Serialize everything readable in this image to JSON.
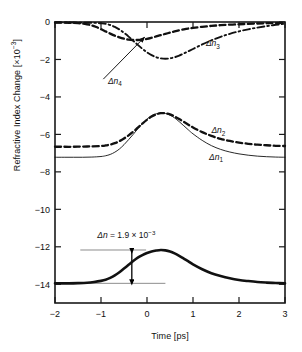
{
  "chart_data": {
    "type": "line",
    "title": "",
    "xlabel": "Time [ps]",
    "ylabel": "Refractive Index Change [×10⁻³]",
    "ylabel_base": "Refractive Index Change [×10",
    "ylabel_exp": "−3",
    "ylabel_tail": "]",
    "xlim": [
      -2,
      3
    ],
    "ylim": [
      -15,
      0
    ],
    "grid": false,
    "legend": "inline-curve-labels",
    "xticks": [
      -2,
      -1,
      0,
      1,
      2,
      3
    ],
    "xticklabels": [
      "−2",
      "−1",
      "0",
      "1",
      "2",
      "3"
    ],
    "yticks": [
      0,
      -2,
      -4,
      -6,
      -8,
      -10,
      -12,
      -14
    ],
    "yticklabels": [
      "0",
      "−2",
      "−4",
      "−6",
      "−8",
      "−10",
      "−12",
      "−14"
    ],
    "series": [
      {
        "name": "Δn1",
        "label_base": "Δn",
        "label_sub": "1",
        "style": "solid-thin",
        "label_x": 1.35,
        "label_y": -7.35,
        "points": [
          [
            -2.0,
            -7.22
          ],
          [
            -1.8,
            -7.22
          ],
          [
            -1.6,
            -7.22
          ],
          [
            -1.4,
            -7.22
          ],
          [
            -1.2,
            -7.21
          ],
          [
            -1.0,
            -7.18
          ],
          [
            -0.9,
            -7.14
          ],
          [
            -0.8,
            -7.07
          ],
          [
            -0.7,
            -6.95
          ],
          [
            -0.6,
            -6.78
          ],
          [
            -0.5,
            -6.55
          ],
          [
            -0.4,
            -6.28
          ],
          [
            -0.3,
            -6.0
          ],
          [
            -0.2,
            -5.7
          ],
          [
            -0.1,
            -5.42
          ],
          [
            0.0,
            -5.18
          ],
          [
            0.1,
            -5.0
          ],
          [
            0.2,
            -4.9
          ],
          [
            0.3,
            -4.86
          ],
          [
            0.4,
            -4.88
          ],
          [
            0.5,
            -4.97
          ],
          [
            0.6,
            -5.12
          ],
          [
            0.7,
            -5.32
          ],
          [
            0.8,
            -5.54
          ],
          [
            0.9,
            -5.76
          ],
          [
            1.0,
            -5.97
          ],
          [
            1.2,
            -6.32
          ],
          [
            1.4,
            -6.6
          ],
          [
            1.6,
            -6.8
          ],
          [
            1.8,
            -6.94
          ],
          [
            2.0,
            -7.04
          ],
          [
            2.2,
            -7.11
          ],
          [
            2.4,
            -7.16
          ],
          [
            2.6,
            -7.19
          ],
          [
            2.8,
            -7.21
          ],
          [
            3.0,
            -7.22
          ]
        ]
      },
      {
        "name": "Δn2",
        "label_base": "Δn",
        "label_sub": "2",
        "style": "dashed-thick",
        "label_x": 1.4,
        "label_y": -5.95,
        "points": [
          [
            -2.0,
            -6.66
          ],
          [
            -1.8,
            -6.66
          ],
          [
            -1.6,
            -6.66
          ],
          [
            -1.4,
            -6.65
          ],
          [
            -1.2,
            -6.64
          ],
          [
            -1.0,
            -6.62
          ],
          [
            -0.9,
            -6.59
          ],
          [
            -0.8,
            -6.54
          ],
          [
            -0.7,
            -6.47
          ],
          [
            -0.6,
            -6.36
          ],
          [
            -0.5,
            -6.22
          ],
          [
            -0.4,
            -6.05
          ],
          [
            -0.3,
            -5.86
          ],
          [
            -0.2,
            -5.64
          ],
          [
            -0.1,
            -5.42
          ],
          [
            0.0,
            -5.22
          ],
          [
            0.1,
            -5.05
          ],
          [
            0.2,
            -4.93
          ],
          [
            0.3,
            -4.87
          ],
          [
            0.4,
            -4.87
          ],
          [
            0.5,
            -4.93
          ],
          [
            0.6,
            -5.04
          ],
          [
            0.7,
            -5.18
          ],
          [
            0.8,
            -5.33
          ],
          [
            0.9,
            -5.48
          ],
          [
            1.0,
            -5.63
          ],
          [
            1.2,
            -5.88
          ],
          [
            1.4,
            -6.08
          ],
          [
            1.6,
            -6.24
          ],
          [
            1.8,
            -6.35
          ],
          [
            2.0,
            -6.44
          ],
          [
            2.2,
            -6.5
          ],
          [
            2.4,
            -6.55
          ],
          [
            2.6,
            -6.58
          ],
          [
            2.8,
            -6.61
          ],
          [
            3.0,
            -6.62
          ]
        ]
      },
      {
        "name": "Δn3",
        "label_base": "Δn",
        "label_sub": "3",
        "style": "dash-dot",
        "label_x": 1.28,
        "label_y": -1.28,
        "points": [
          [
            -2.0,
            -0.03
          ],
          [
            -1.6,
            -0.03
          ],
          [
            -1.3,
            -0.04
          ],
          [
            -1.1,
            -0.05
          ],
          [
            -1.0,
            -0.07
          ],
          [
            -0.9,
            -0.1
          ],
          [
            -0.8,
            -0.16
          ],
          [
            -0.7,
            -0.26
          ],
          [
            -0.6,
            -0.4
          ],
          [
            -0.5,
            -0.58
          ],
          [
            -0.4,
            -0.78
          ],
          [
            -0.3,
            -1.0
          ],
          [
            -0.2,
            -1.22
          ],
          [
            -0.1,
            -1.43
          ],
          [
            0.0,
            -1.62
          ],
          [
            0.1,
            -1.77
          ],
          [
            0.2,
            -1.88
          ],
          [
            0.3,
            -1.94
          ],
          [
            0.4,
            -1.96
          ],
          [
            0.5,
            -1.94
          ],
          [
            0.6,
            -1.88
          ],
          [
            0.7,
            -1.79
          ],
          [
            0.8,
            -1.68
          ],
          [
            0.9,
            -1.56
          ],
          [
            1.0,
            -1.44
          ],
          [
            1.2,
            -1.2
          ],
          [
            1.4,
            -0.98
          ],
          [
            1.6,
            -0.79
          ],
          [
            1.8,
            -0.63
          ],
          [
            2.0,
            -0.5
          ],
          [
            2.2,
            -0.39
          ],
          [
            2.4,
            -0.3
          ],
          [
            2.6,
            -0.22
          ],
          [
            2.8,
            -0.15
          ],
          [
            3.0,
            -0.09
          ]
        ]
      },
      {
        "name": "Δn4",
        "label_base": "Δn",
        "label_sub": "4",
        "style": "dashed-thick",
        "label_x": -0.85,
        "label_y": -3.3,
        "points": [
          [
            -2.0,
            -0.03
          ],
          [
            -1.7,
            -0.04
          ],
          [
            -1.5,
            -0.06
          ],
          [
            -1.35,
            -0.1
          ],
          [
            -1.2,
            -0.18
          ],
          [
            -1.1,
            -0.27
          ],
          [
            -1.0,
            -0.38
          ],
          [
            -0.9,
            -0.5
          ],
          [
            -0.8,
            -0.62
          ],
          [
            -0.7,
            -0.73
          ],
          [
            -0.6,
            -0.82
          ],
          [
            -0.5,
            -0.89
          ],
          [
            -0.4,
            -0.94
          ],
          [
            -0.3,
            -0.96
          ],
          [
            -0.2,
            -0.96
          ],
          [
            -0.1,
            -0.94
          ],
          [
            0.0,
            -0.9
          ],
          [
            0.1,
            -0.84
          ],
          [
            0.2,
            -0.77
          ],
          [
            0.3,
            -0.7
          ],
          [
            0.45,
            -0.6
          ],
          [
            0.6,
            -0.5
          ],
          [
            0.8,
            -0.39
          ],
          [
            1.0,
            -0.31
          ],
          [
            1.3,
            -0.23
          ],
          [
            1.6,
            -0.17
          ],
          [
            2.0,
            -0.12
          ],
          [
            2.4,
            -0.08
          ],
          [
            2.7,
            -0.06
          ],
          [
            3.0,
            -0.05
          ]
        ]
      },
      {
        "name": "Δn-bottom",
        "label_base": "",
        "label_sub": "",
        "style": "solid-extrathick",
        "label_x": null,
        "label_y": null,
        "points": [
          [
            -2.0,
            -13.95
          ],
          [
            -1.7,
            -13.95
          ],
          [
            -1.5,
            -13.94
          ],
          [
            -1.3,
            -13.92
          ],
          [
            -1.15,
            -13.88
          ],
          [
            -1.0,
            -13.82
          ],
          [
            -0.9,
            -13.76
          ],
          [
            -0.8,
            -13.66
          ],
          [
            -0.7,
            -13.53
          ],
          [
            -0.6,
            -13.36
          ],
          [
            -0.5,
            -13.16
          ],
          [
            -0.4,
            -12.96
          ],
          [
            -0.3,
            -12.76
          ],
          [
            -0.2,
            -12.58
          ],
          [
            -0.1,
            -12.44
          ],
          [
            0.0,
            -12.33
          ],
          [
            0.1,
            -12.25
          ],
          [
            0.2,
            -12.2
          ],
          [
            0.3,
            -12.17
          ],
          [
            0.4,
            -12.19
          ],
          [
            0.5,
            -12.25
          ],
          [
            0.6,
            -12.35
          ],
          [
            0.7,
            -12.48
          ],
          [
            0.8,
            -12.63
          ],
          [
            0.9,
            -12.78
          ],
          [
            1.0,
            -12.94
          ],
          [
            1.2,
            -13.2
          ],
          [
            1.4,
            -13.41
          ],
          [
            1.6,
            -13.56
          ],
          [
            1.8,
            -13.68
          ],
          [
            2.0,
            -13.77
          ],
          [
            2.2,
            -13.83
          ],
          [
            2.4,
            -13.88
          ],
          [
            2.6,
            -13.91
          ],
          [
            2.8,
            -13.93
          ],
          [
            3.0,
            -13.95
          ]
        ]
      }
    ],
    "annotations": [
      {
        "name": "delta-n-measurement",
        "text_base": "Δn",
        "text_eq": " = 1.9 × 10",
        "text_exp": "−3",
        "full_text": "Δn = 1.9 × 10⁻³",
        "text_x": -0.45,
        "text_y": -11.55,
        "guide_top_y": -12.17,
        "guide_top_x0": -1.45,
        "guide_top_x1": -0.02,
        "guide_bot_y": -13.95,
        "guide_bot_x0": -1.62,
        "guide_bot_x1": 0.4,
        "arrow_x": -0.33,
        "arrow_y0": -12.22,
        "arrow_y1": -13.9
      },
      {
        "name": "delta-n4-pointer",
        "text": "Δn4",
        "arrow_from_x": -0.95,
        "arrow_from_y": -3.05,
        "arrow_to_x": -0.05,
        "arrow_to_y": -0.8
      }
    ]
  }
}
